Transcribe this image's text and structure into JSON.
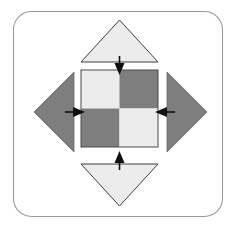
{
  "figure": {
    "description": "A rounded square frame containing a central 2x2 checkerboard square with four triangles arranged around it (top, bottom, left, right), each with an arrow pointing inward toward the center square.",
    "canvas": {
      "width": 238,
      "height": 233,
      "background": "#ffffff"
    },
    "frame": {
      "name": "outer-frame",
      "x": 13,
      "y": 11,
      "width": 209,
      "height": 205,
      "corner_radius": 18,
      "stroke_color": "#9a9a9a",
      "stroke_width": 1,
      "fill": "none"
    },
    "colors": {
      "light_gray": "#ececec",
      "dark_gray": "#7e7e7e",
      "outline": "#3a3a3a",
      "arrow": "#101010",
      "frame": "#9a9a9a",
      "background": "#ffffff"
    },
    "center_square": {
      "name": "checkerboard-square",
      "x": 81,
      "y": 70,
      "size": 77,
      "center_x": 119.5,
      "center_y": 108.5,
      "outline_color": "#4a4a4a",
      "quadrants": [
        {
          "name": "quadrant-top-left",
          "position": "top-left",
          "shade": "light",
          "color": "#ececec"
        },
        {
          "name": "quadrant-top-right",
          "position": "top-right",
          "shade": "dark",
          "color": "#7e7e7e"
        },
        {
          "name": "quadrant-bottom-left",
          "position": "bottom-left",
          "shade": "dark",
          "color": "#7e7e7e"
        },
        {
          "name": "quadrant-bottom-right",
          "position": "bottom-right",
          "shade": "light",
          "color": "#ececec"
        }
      ]
    },
    "triangles": [
      {
        "name": "triangle-top",
        "direction": "up",
        "shade": "light",
        "color": "#ececec",
        "points": "119.5,20 158,62 81,62"
      },
      {
        "name": "triangle-bottom",
        "direction": "down",
        "shade": "light",
        "color": "#ececec",
        "points": "119.5,206 81,164 158,164"
      },
      {
        "name": "triangle-left",
        "direction": "left",
        "shade": "dark",
        "color": "#7e7e7e",
        "points": "34,112 74,72 74,152"
      },
      {
        "name": "triangle-right",
        "direction": "right",
        "shade": "dark",
        "color": "#7e7e7e",
        "points": "207,112 167,72 167,152"
      }
    ],
    "arrows": [
      {
        "name": "arrow-down-top",
        "direction": "down",
        "points_inward": true,
        "x1": 119.5,
        "y1": 62,
        "x2": 119.5,
        "y2": 75,
        "color": "#101010"
      },
      {
        "name": "arrow-up-bottom",
        "direction": "up",
        "points_inward": true,
        "x1": 119.5,
        "y1": 164,
        "x2": 119.5,
        "y2": 151,
        "color": "#101010"
      },
      {
        "name": "arrow-right-left",
        "direction": "right",
        "points_inward": true,
        "x1": 71,
        "y1": 112,
        "x2": 85,
        "y2": 112,
        "color": "#101010"
      },
      {
        "name": "arrow-left-right",
        "direction": "left",
        "points_inward": true,
        "x1": 169,
        "y1": 112,
        "x2": 155,
        "y2": 112,
        "color": "#101010"
      }
    ],
    "labels": {
      "visible_text": ""
    }
  }
}
